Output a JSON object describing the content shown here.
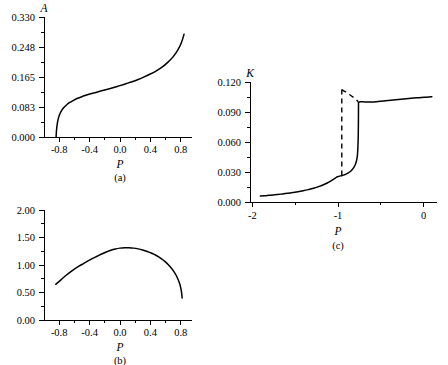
{
  "figure": {
    "background_color": "#ffffff",
    "line_color": "#000000"
  },
  "chart_data": [
    {
      "id": "a",
      "type": "line",
      "title": "",
      "caption": "(a)",
      "xlabel": "P",
      "ylabel": "A",
      "xlim": [
        -1.0,
        0.95
      ],
      "ylim": [
        0.0,
        0.3715
      ],
      "grid": false,
      "legend": null,
      "xticks": [
        -0.8,
        -0.4,
        0.0,
        0.4,
        0.8
      ],
      "xticklabels": [
        "-0.8",
        "-0.4",
        "0.0",
        "0.4",
        "0.8"
      ],
      "yticks": [
        0.0,
        0.083,
        0.165,
        0.248,
        0.33
      ],
      "yticklabels": [
        "0.000",
        "0.083",
        "0.165",
        "0.248",
        "0.330"
      ],
      "series": [
        {
          "name": "A(P)",
          "style": "solid",
          "x": [
            -0.84,
            -0.838,
            -0.834,
            -0.828,
            -0.82,
            -0.808,
            -0.79,
            -0.765,
            -0.735,
            -0.7,
            -0.66,
            -0.615,
            -0.565,
            -0.51,
            -0.45,
            -0.385,
            -0.315,
            -0.24,
            -0.16,
            -0.08,
            0.0,
            0.08,
            0.16,
            0.24,
            0.32,
            0.4,
            0.48,
            0.56,
            0.63,
            0.7,
            0.76,
            0.81,
            0.845
          ],
          "y": [
            0.0,
            0.012,
            0.024,
            0.036,
            0.048,
            0.06,
            0.072,
            0.083,
            0.092,
            0.1,
            0.107,
            0.113,
            0.119,
            0.124,
            0.129,
            0.134,
            0.138,
            0.143,
            0.148,
            0.153,
            0.159,
            0.165,
            0.171,
            0.178,
            0.186,
            0.195,
            0.205,
            0.217,
            0.231,
            0.248,
            0.268,
            0.292,
            0.318
          ]
        }
      ]
    },
    {
      "id": "b",
      "type": "line",
      "title": "",
      "caption": "(b)",
      "xlabel": "P",
      "ylabel": "",
      "xlim": [
        -1.0,
        0.95
      ],
      "ylim": [
        0.0,
        2.25
      ],
      "grid": false,
      "legend": null,
      "xticks": [
        -0.8,
        -0.4,
        0.0,
        0.4,
        0.8
      ],
      "xticklabels": [
        "-0.8",
        "-0.4",
        "0.0",
        "0.4",
        "0.8"
      ],
      "yticks": [
        0.0,
        0.5,
        1.0,
        1.5,
        2.0
      ],
      "yticklabels": [
        "0.00",
        "0.50",
        "1.00",
        "1.50",
        "2.00"
      ],
      "series": [
        {
          "name": "curve-b",
          "style": "solid",
          "x": [
            -0.845,
            -0.8,
            -0.75,
            -0.7,
            -0.65,
            -0.6,
            -0.54,
            -0.48,
            -0.42,
            -0.36,
            -0.3,
            -0.24,
            -0.18,
            -0.12,
            -0.06,
            0.0,
            0.06,
            0.12,
            0.18,
            0.24,
            0.3,
            0.36,
            0.42,
            0.48,
            0.54,
            0.6,
            0.66,
            0.71,
            0.755,
            0.79,
            0.81,
            0.82
          ],
          "y": [
            0.73,
            0.79,
            0.86,
            0.925,
            0.985,
            1.04,
            1.1,
            1.155,
            1.21,
            1.26,
            1.305,
            1.35,
            1.39,
            1.425,
            1.452,
            1.47,
            1.478,
            1.477,
            1.47,
            1.455,
            1.432,
            1.402,
            1.365,
            1.32,
            1.262,
            1.19,
            1.095,
            0.995,
            0.87,
            0.73,
            0.59,
            0.45
          ]
        }
      ]
    },
    {
      "id": "c",
      "type": "line",
      "title": "",
      "caption": "(c)",
      "xlabel": "P",
      "ylabel": "K",
      "xlim": [
        -2.12,
        0.06
      ],
      "ylim": [
        0.0,
        0.134
      ],
      "grid": false,
      "legend": null,
      "xticks": [
        -2,
        -1,
        0
      ],
      "xticklabels": [
        "-2",
        "-1",
        "0"
      ],
      "yticks": [
        0.0,
        0.03,
        0.06,
        0.09,
        0.12
      ],
      "yticklabels": [
        "0.000",
        "0.030",
        "0.060",
        "0.090",
        "0.120"
      ],
      "series": [
        {
          "name": "lower-branch",
          "style": "solid",
          "x": [
            -2.0,
            -1.95,
            -1.9,
            -1.85,
            -1.8,
            -1.74,
            -1.68,
            -1.62,
            -1.56,
            -1.5,
            -1.44,
            -1.38,
            -1.32,
            -1.27,
            -1.22,
            -1.18,
            -1.14,
            -1.11,
            -1.085,
            -1.065,
            -1.05
          ],
          "y": [
            0.0068,
            0.0071,
            0.0075,
            0.0079,
            0.0084,
            0.009,
            0.0097,
            0.0105,
            0.0114,
            0.0125,
            0.0138,
            0.0153,
            0.0172,
            0.019,
            0.0212,
            0.0233,
            0.0257,
            0.0277,
            0.0286,
            0.0292,
            0.0295
          ]
        },
        {
          "name": "lower-branch-continued",
          "style": "solid",
          "x": [
            -1.05,
            -1.03,
            -1.01,
            -0.99,
            -0.97,
            -0.95,
            -0.93,
            -0.915,
            -0.9,
            -0.89,
            -0.88,
            -0.872,
            -0.866,
            -0.862,
            -0.858,
            -0.856,
            -0.855
          ],
          "y": [
            0.0295,
            0.03,
            0.0307,
            0.0316,
            0.0327,
            0.0341,
            0.036,
            0.0378,
            0.0402,
            0.0424,
            0.0455,
            0.049,
            0.0545,
            0.062,
            0.074,
            0.092,
            0.111
          ]
        },
        {
          "name": "upper-branch",
          "style": "solid",
          "x": [
            -0.855,
            -0.845,
            -0.83,
            -0.81,
            -0.78,
            -0.74,
            -0.7,
            -0.65,
            -0.6,
            -0.54,
            -0.48,
            -0.42,
            -0.36,
            -0.3,
            -0.24,
            -0.18,
            -0.12,
            -0.06,
            0.0
          ],
          "y": [
            0.111,
            0.1118,
            0.112,
            0.1119,
            0.1117,
            0.1116,
            0.1117,
            0.112,
            0.1124,
            0.113,
            0.1136,
            0.1142,
            0.1148,
            0.1153,
            0.1158,
            0.1163,
            0.1167,
            0.1171,
            0.1174
          ]
        },
        {
          "name": "spinodal-jump",
          "style": "dashed",
          "x": [
            -1.05,
            -1.05
          ],
          "y": [
            0.0295,
            0.1255
          ]
        },
        {
          "name": "unstable-branch",
          "style": "dashed",
          "x": [
            -1.05,
            -1.01,
            -0.96,
            -0.91,
            -0.875,
            -0.858
          ],
          "y": [
            0.1255,
            0.1232,
            0.12,
            0.1165,
            0.1135,
            0.1118
          ]
        }
      ]
    }
  ]
}
